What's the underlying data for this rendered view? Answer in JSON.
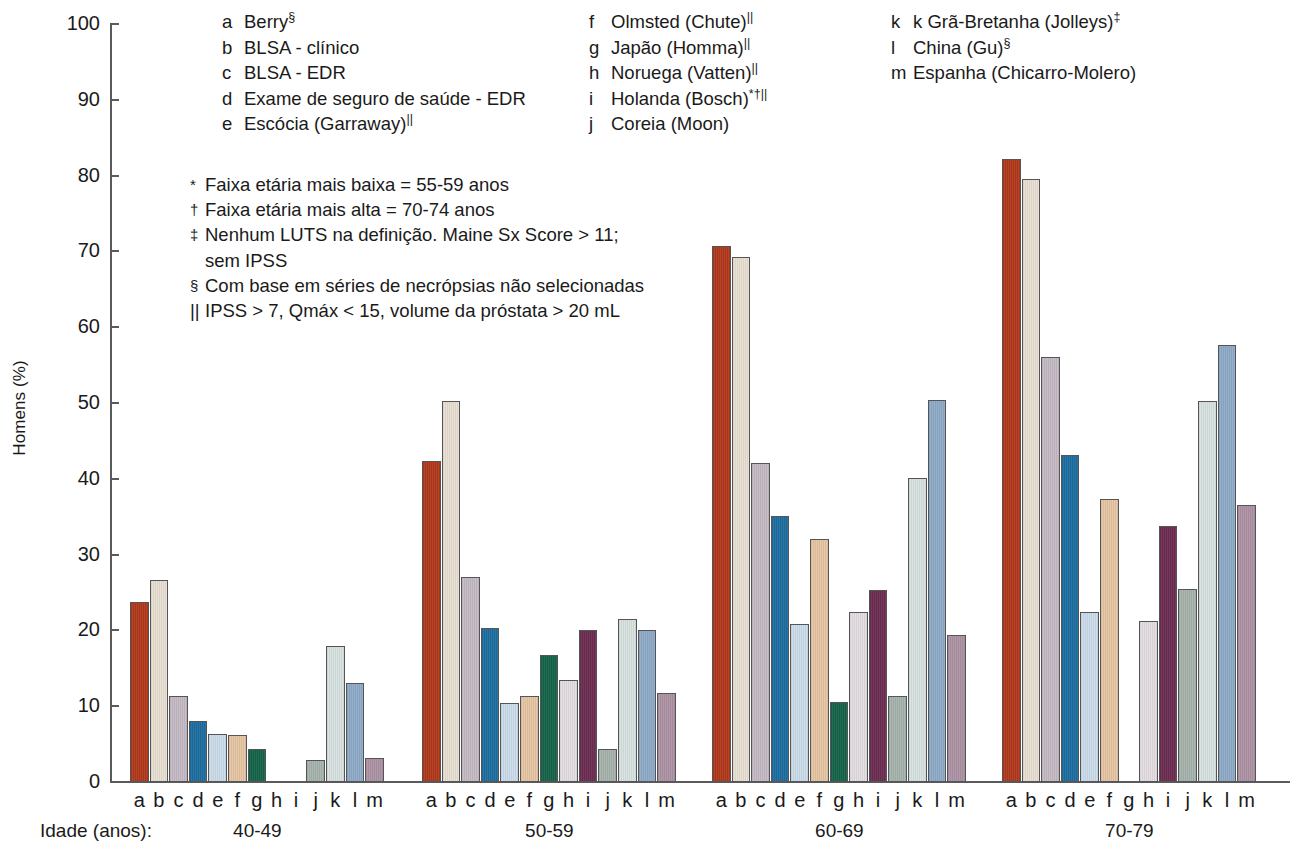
{
  "axis": {
    "y_title": "Homens (%)",
    "y_ticks": [
      "0",
      "10",
      "20",
      "30",
      "40",
      "50",
      "60",
      "70",
      "80",
      "90",
      "100"
    ],
    "x_title": "Idade (anos):"
  },
  "legend": {
    "columns": [
      [
        {
          "key": "a",
          "name": "Berry",
          "sup": "§"
        },
        {
          "key": "b",
          "name": "BLSA - clínico",
          "sup": ""
        },
        {
          "key": "c",
          "name": "BLSA - EDR",
          "sup": ""
        },
        {
          "key": "d",
          "name": "Exame de seguro de saúde - EDR",
          "sup": ""
        },
        {
          "key": "e",
          "name": "Escócia (Garraway)",
          "sup": "||"
        }
      ],
      [
        {
          "key": "f",
          "name": "Olmsted (Chute)",
          "sup": "||"
        },
        {
          "key": "g",
          "name": "Japão (Homma)",
          "sup": "||"
        },
        {
          "key": "h",
          "name": "Noruega (Vatten)",
          "sup": "||"
        },
        {
          "key": "i",
          "name": "Holanda (Bosch)",
          "sup": "*†||"
        },
        {
          "key": "j",
          "name": "Coreia (Moon)",
          "sup": ""
        }
      ],
      [
        {
          "key": "k",
          "name": "k Grã-Bretanha (Jolleys)",
          "sup": "‡"
        },
        {
          "key": "l",
          "name": "China (Gu)",
          "sup": "§"
        },
        {
          "key": "m",
          "name": "Espanha (Chicarro-Molero)",
          "sup": ""
        }
      ]
    ]
  },
  "footnotes": [
    {
      "marker": "*",
      "text": "Faixa etária mais baixa = 55-59 anos",
      "cont": ""
    },
    {
      "marker": "†",
      "text": "Faixa etária mais alta = 70-74 anos",
      "cont": ""
    },
    {
      "marker": "‡",
      "text": "Nenhum LUTS na definição. Maine Sx Score > 11;",
      "cont": "sem IPSS"
    },
    {
      "marker": "§",
      "text": "Com base em séries de necrópsias não selecionadas",
      "cont": ""
    },
    {
      "marker": "||",
      "text": "IPSS > 7, Qmáx < 15, volume da próstata > 20 mL",
      "cont": ""
    }
  ],
  "series_colors": {
    "a": "#b1391c",
    "b": "#e8e0d2",
    "c": "#c4bac4",
    "d": "#1e6ea0",
    "e": "#ccdcea",
    "f": "#e6c5a3",
    "g": "#16644a",
    "h": "#e3dde2",
    "i": "#6d2d52",
    "j": "#a7b3ad",
    "k": "#d7e2e0",
    "l": "#8fabc8",
    "m": "#ad93a4"
  },
  "chart_data": {
    "type": "bar",
    "title": "",
    "xlabel": "Idade (anos):",
    "ylabel": "Homens (%)",
    "ylim": [
      0,
      100
    ],
    "ytick_step": 10,
    "grid": false,
    "legend_position": "top",
    "categories": [
      "40-49",
      "50-59",
      "60-69",
      "70-79"
    ],
    "series_keys": [
      "a",
      "b",
      "c",
      "d",
      "e",
      "f",
      "g",
      "h",
      "i",
      "j",
      "k",
      "l",
      "m"
    ],
    "series": [
      {
        "name": "a",
        "label": "Berry",
        "values": [
          23.7,
          42.4,
          70.7,
          82.2
        ]
      },
      {
        "name": "b",
        "label": "BLSA - clínico",
        "values": [
          26.6,
          50.2,
          69.2,
          79.6
        ]
      },
      {
        "name": "c",
        "label": "BLSA - EDR",
        "values": [
          11.3,
          27.0,
          42.1,
          56.1
        ]
      },
      {
        "name": "d",
        "label": "Exame de seguro de saúde - EDR",
        "values": [
          8.1,
          20.3,
          35.1,
          43.1
        ]
      },
      {
        "name": "e",
        "label": "Escócia (Garraway)",
        "values": [
          6.4,
          10.4,
          20.9,
          22.4
        ]
      },
      {
        "name": "f",
        "label": "Olmsted (Chute)",
        "values": [
          6.2,
          11.4,
          32.0,
          37.4
        ]
      },
      {
        "name": "g",
        "label": "Japão (Homma)",
        "values": [
          4.3,
          16.8,
          10.5,
          null
        ]
      },
      {
        "name": "h",
        "label": "Noruega (Vatten)",
        "values": [
          null,
          13.4,
          22.4,
          21.3
        ]
      },
      {
        "name": "i",
        "label": "Holanda (Bosch)",
        "values": [
          null,
          20.1,
          25.3,
          33.8
        ]
      },
      {
        "name": "j",
        "label": "Coreia (Moon)",
        "values": [
          2.9,
          4.3,
          11.3,
          25.4
        ]
      },
      {
        "name": "k",
        "label": "k Grã-Bretanha (Jolleys)",
        "values": [
          17.9,
          21.5,
          40.1,
          50.3
        ]
      },
      {
        "name": "l",
        "label": "China (Gu)",
        "values": [
          13.1,
          20.1,
          50.4,
          57.6
        ]
      },
      {
        "name": "m",
        "label": "Espanha (Chicarro-Molero)",
        "values": [
          3.2,
          11.7,
          19.4,
          36.5
        ]
      }
    ]
  }
}
